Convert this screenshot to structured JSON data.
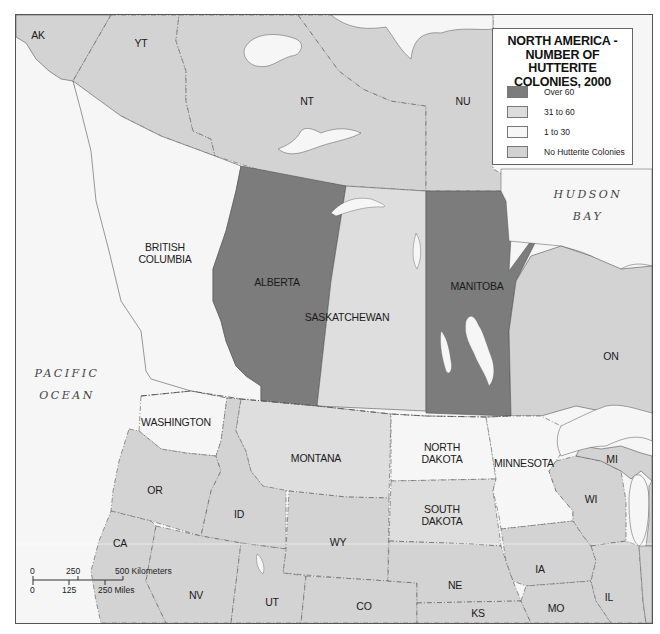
{
  "legend": {
    "title_lines": [
      "NORTH AMERICA -",
      "NUMBER OF HUTTERITE",
      "COLONIES, 2000"
    ],
    "items": [
      {
        "label": "Over 60",
        "color": "#7c7c7c"
      },
      {
        "label": "31 to 60",
        "color": "#dcdcdc"
      },
      {
        "label": "1 to 30",
        "color": "#f6f6f6"
      },
      {
        "label": "No Hutterite Colonies",
        "color": "#d2d2d2"
      }
    ]
  },
  "colors": {
    "over_60": "#7c7c7c",
    "31_to_60": "#dedede",
    "1_to_30": "#f6f6f6",
    "none": "#d3d3d3",
    "water": "#f6f6f6",
    "border": "#555555"
  },
  "regions": {
    "ak": {
      "label": "AK",
      "category": "none"
    },
    "yt": {
      "label": "YT",
      "category": "none"
    },
    "nt": {
      "label": "NT",
      "category": "none"
    },
    "nu": {
      "label": "NU",
      "category": "none"
    },
    "bc": {
      "label": "BRITISH\nCOLUMBIA",
      "line1": "BRITISH",
      "line2": "COLUMBIA",
      "category": "1_to_30"
    },
    "alberta": {
      "label": "ALBERTA",
      "category": "over_60"
    },
    "saskatchewan": {
      "label": "SASKATCHEWAN",
      "category": "31_to_60"
    },
    "manitoba": {
      "label": "MANITOBA",
      "category": "over_60"
    },
    "on": {
      "label": "ON",
      "category": "none"
    },
    "washington": {
      "label": "WASHINGTON",
      "category": "1_to_30"
    },
    "montana": {
      "label": "MONTANA",
      "category": "31_to_60"
    },
    "north_dakota": {
      "line1": "NORTH",
      "line2": "DAKOTA",
      "category": "1_to_30"
    },
    "minnesota": {
      "label": "MINNESOTA",
      "category": "1_to_30"
    },
    "south_dakota": {
      "line1": "SOUTH",
      "line2": "DAKOTA",
      "category": "31_to_60"
    },
    "mi": {
      "label": "MI",
      "category": "none"
    },
    "wi": {
      "label": "WI",
      "category": "none"
    },
    "or": {
      "label": "OR",
      "category": "none"
    },
    "id": {
      "label": "ID",
      "category": "none"
    },
    "wy": {
      "label": "WY",
      "category": "none"
    },
    "ca": {
      "label": "CA",
      "category": "none"
    },
    "nv": {
      "label": "NV",
      "category": "none"
    },
    "ut": {
      "label": "UT",
      "category": "none"
    },
    "co": {
      "label": "CO",
      "category": "none"
    },
    "ne": {
      "label": "NE",
      "category": "none"
    },
    "ia": {
      "label": "IA",
      "category": "none"
    },
    "ks": {
      "label": "KS",
      "category": "none"
    },
    "mo": {
      "label": "MO",
      "category": "none"
    },
    "il": {
      "label": "IL",
      "category": "none"
    }
  },
  "water": {
    "pacific_ocean": "PACIFIC\nOCEAN",
    "hudson_bay": "HUDSON\nBAY"
  },
  "scale": {
    "km_ticks": [
      "0",
      "250",
      "500 Kilometers"
    ],
    "mi_ticks": [
      "0",
      "125",
      "250 Miles"
    ]
  }
}
